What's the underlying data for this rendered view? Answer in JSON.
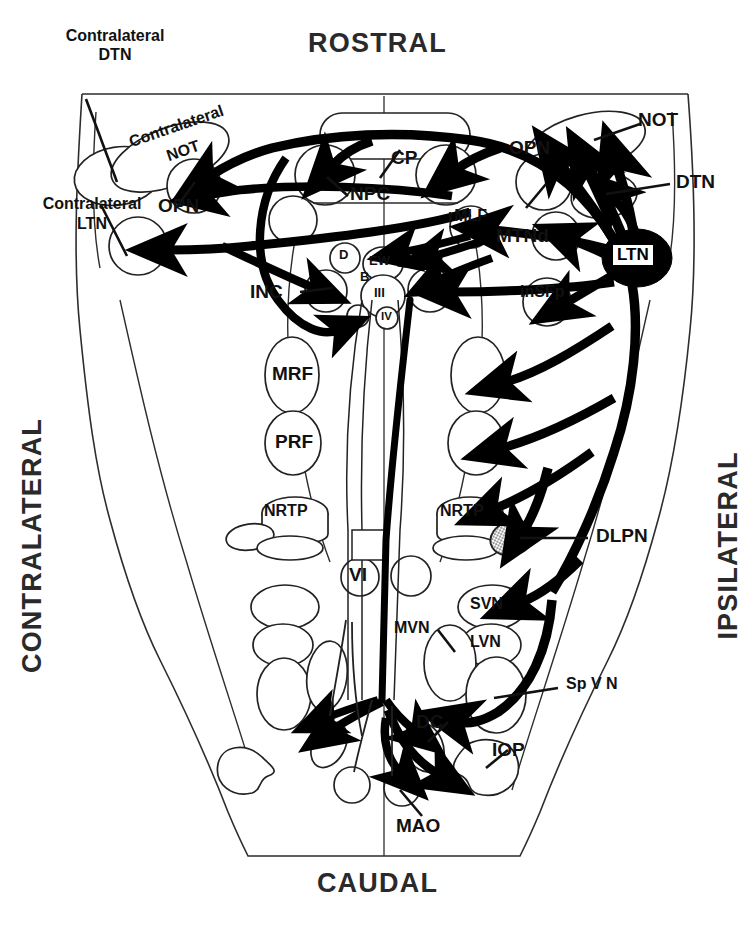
{
  "figure": {
    "type": "neuroanatomical-connectivity-diagram"
  },
  "orientation": {
    "top": "ROSTRAL",
    "bottom": "CAUDAL",
    "left": "CONTRALATERAL",
    "right": "IPSILATERAL"
  },
  "labels": {
    "contralateral_dtn": "Contralateral\nDTN",
    "contralateral_dtn_l1": "Contralateral",
    "contralateral_dtn_l2": "DTN",
    "contralateral_not_l1": "Contralateral",
    "contralateral_not_l2": "NOT",
    "contralateral_ltn_l1": "Contralateral",
    "contralateral_ltn_l2": "LTN",
    "opn_left": "OPN",
    "opn_right": "OPN",
    "cp": "CP",
    "npc": "NPC",
    "not": "NOT",
    "dtn": "DTN",
    "rmlf": "rMLF",
    "mtnd": "MTNd",
    "ltn": "LTN",
    "insfp": "inSFp",
    "inc": "INC",
    "d": "D",
    "b": "B",
    "ew": "EW",
    "iii": "III",
    "iv": "IV",
    "mrf": "MRF",
    "prf": "PRF",
    "nrtp_left": "NRTP",
    "nrtp_right": "NRTP",
    "dlpn": "DLPN",
    "vi": "VI",
    "svn": "SVN",
    "lvn": "LVN",
    "mvn": "MVN",
    "spvn": "Sp V N",
    "dc": "DC",
    "iop": "IOP",
    "mao": "MAO"
  },
  "nuclei": [
    {
      "id": "contralateral-not",
      "label": "Contralateral NOT",
      "side": "contralateral"
    },
    {
      "id": "contralateral-dtn",
      "label": "Contralateral DTN",
      "side": "contralateral"
    },
    {
      "id": "contralateral-ltn",
      "label": "Contralateral LTN",
      "side": "contralateral"
    },
    {
      "id": "opn-left",
      "label": "OPN",
      "side": "contralateral"
    },
    {
      "id": "npc",
      "label": "NPC",
      "side": "midline"
    },
    {
      "id": "cp",
      "label": "CP",
      "side": "midline"
    },
    {
      "id": "inc",
      "label": "INC",
      "side": "contralateral"
    },
    {
      "id": "d",
      "label": "D",
      "side": "midline"
    },
    {
      "id": "b",
      "label": "B",
      "side": "midline"
    },
    {
      "id": "ew",
      "label": "EW",
      "side": "midline"
    },
    {
      "id": "iii",
      "label": "III",
      "side": "midline"
    },
    {
      "id": "iv",
      "label": "IV",
      "side": "midline"
    },
    {
      "id": "rmlf",
      "label": "rMLF",
      "side": "ipsilateral"
    },
    {
      "id": "mtnd",
      "label": "MTNd",
      "side": "ipsilateral"
    },
    {
      "id": "insfp",
      "label": "inSFp",
      "side": "ipsilateral"
    },
    {
      "id": "not",
      "label": "NOT",
      "side": "ipsilateral"
    },
    {
      "id": "dtn",
      "label": "DTN",
      "side": "ipsilateral"
    },
    {
      "id": "opn-right",
      "label": "OPN",
      "side": "ipsilateral"
    },
    {
      "id": "ltn",
      "label": "LTN",
      "side": "ipsilateral",
      "highlight": true
    },
    {
      "id": "mrf",
      "label": "MRF",
      "side": "contralateral"
    },
    {
      "id": "prf",
      "label": "PRF",
      "side": "contralateral"
    },
    {
      "id": "nrtp-left",
      "label": "NRTP",
      "side": "contralateral"
    },
    {
      "id": "nrtp-right",
      "label": "NRTP",
      "side": "ipsilateral"
    },
    {
      "id": "dlpn",
      "label": "DLPN",
      "side": "ipsilateral",
      "shaded": true
    },
    {
      "id": "vi",
      "label": "VI",
      "side": "midline"
    },
    {
      "id": "svn",
      "label": "SVN",
      "side": "ipsilateral"
    },
    {
      "id": "lvn",
      "label": "LVN",
      "side": "ipsilateral"
    },
    {
      "id": "mvn",
      "label": "MVN",
      "side": "ipsilateral"
    },
    {
      "id": "spvn",
      "label": "Sp V N",
      "side": "ipsilateral"
    },
    {
      "id": "dc",
      "label": "DC",
      "side": "midline"
    },
    {
      "id": "iop",
      "label": "IOP",
      "side": "ipsilateral"
    },
    {
      "id": "mao",
      "label": "MAO",
      "side": "midline"
    }
  ],
  "colors": {
    "ink": "#000000",
    "outline": "#1b1b1b",
    "background": "#ffffff",
    "shaded_fill": "#b9b9b9",
    "ltn_fill": "#000000",
    "ltn_text": "#000000"
  }
}
